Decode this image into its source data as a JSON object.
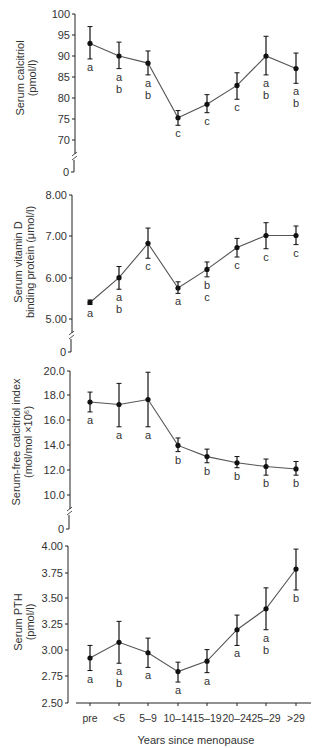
{
  "chart_data": [
    {
      "type": "line",
      "panel": 1,
      "title": "",
      "ylabel": [
        "Serum calcitriol",
        "(pmol/l)"
      ],
      "xlabel": "",
      "categories": [
        "pre",
        "<5",
        "5–9",
        "10–14",
        "15–19",
        "20–24",
        "25–29",
        ">29"
      ],
      "values": [
        93.0,
        90.0,
        88.3,
        75.3,
        78.5,
        83.0,
        90.0,
        87.0
      ],
      "err_low": [
        89.3,
        87.0,
        85.5,
        73.5,
        76.5,
        79.7,
        85.5,
        83.5
      ],
      "err_high": [
        97.0,
        93.3,
        91.2,
        77.0,
        80.8,
        86.0,
        94.7,
        90.7
      ],
      "letters": [
        "a",
        "a b",
        "a b",
        "c",
        "c",
        "c",
        "a b",
        "a b"
      ],
      "yticks": [
        "100",
        "95",
        "90",
        "85",
        "80",
        "75",
        "70",
        "0"
      ],
      "ylim": [
        70,
        100
      ],
      "axis_break": true,
      "grid": false
    },
    {
      "type": "line",
      "panel": 2,
      "title": "",
      "ylabel": [
        "Serum vitamin D",
        "binding protein  (μmol/l)"
      ],
      "xlabel": "",
      "categories": [
        "pre",
        "<5",
        "5–9",
        "10–14",
        "15–19",
        "20–24",
        "25–29",
        ">29"
      ],
      "values": [
        5.4,
        6.0,
        6.83,
        5.75,
        6.2,
        6.73,
        7.02,
        7.02
      ],
      "err_low": [
        5.35,
        5.72,
        6.47,
        5.62,
        6.02,
        6.5,
        6.7,
        6.8
      ],
      "err_high": [
        5.46,
        6.27,
        7.2,
        5.9,
        6.38,
        6.95,
        7.33,
        7.25
      ],
      "letters": [
        "a",
        "a b",
        "c",
        "a",
        "b c",
        "c",
        "c",
        "c"
      ],
      "yticks": [
        "8.00",
        "7.00",
        "6.00",
        "5.00",
        "0"
      ],
      "ylim": [
        5.0,
        8.0
      ],
      "axis_break": true,
      "grid": false
    },
    {
      "type": "line",
      "panel": 3,
      "title": "",
      "ylabel": [
        "Serum-free calcitriol index",
        "(mol/mol ×10⁶)"
      ],
      "xlabel": "",
      "categories": [
        "pre",
        "<5",
        "5–9",
        "10–14",
        "15–19",
        "20–24",
        "25–29",
        ">29"
      ],
      "values": [
        17.5,
        17.3,
        17.7,
        14.0,
        13.1,
        12.6,
        12.3,
        12.1
      ],
      "err_low": [
        16.7,
        15.5,
        15.5,
        13.5,
        12.6,
        12.2,
        11.6,
        11.6
      ],
      "err_high": [
        18.3,
        19.0,
        19.9,
        14.6,
        13.7,
        13.1,
        12.9,
        12.7
      ],
      "letters": [
        "a",
        "a",
        "a",
        "b",
        "b",
        "b",
        "b",
        "b"
      ],
      "yticks": [
        "20.0",
        "18.0",
        "16.0",
        "14.0",
        "12.0",
        "10.0",
        "0"
      ],
      "ylim": [
        10.0,
        20.0
      ],
      "axis_break": true,
      "grid": false
    },
    {
      "type": "line",
      "panel": 4,
      "title": "",
      "ylabel": [
        "Serum PTH",
        "(pmol/l)"
      ],
      "xlabel": "Years since menopause",
      "categories": [
        "pre",
        "<5",
        "5–9",
        "10–14",
        "15–19",
        "20–24",
        "25–29",
        ">29"
      ],
      "values": [
        2.93,
        3.08,
        2.98,
        2.8,
        2.9,
        3.2,
        3.4,
        3.78
      ],
      "err_low": [
        2.81,
        2.88,
        2.84,
        2.7,
        2.79,
        3.05,
        3.2,
        3.58
      ],
      "err_high": [
        3.05,
        3.28,
        3.12,
        2.89,
        3.01,
        3.34,
        3.6,
        3.97
      ],
      "letters": [
        "a",
        "a b",
        "a",
        "a",
        "a",
        "a",
        "a b",
        "b"
      ],
      "yticks": [
        "4.00",
        "3.75",
        "3.50",
        "3.25",
        "3.00",
        "2.75",
        "2.50"
      ],
      "ylim": [
        2.5,
        4.0
      ],
      "axis_break": false,
      "grid": false
    }
  ],
  "x_axis": {
    "label": "Years since menopause",
    "ticks": [
      "pre",
      "<5",
      "5–9",
      "10–14",
      "15–19",
      "20–24",
      "25–29",
      ">29"
    ]
  },
  "colors": {
    "line": "#555555",
    "marker": "#111111",
    "axis": "#222222",
    "text": "#333333"
  }
}
